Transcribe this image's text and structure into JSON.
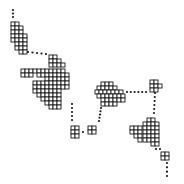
{
  "diagram": {
    "background": "#ffffff",
    "ink": "#1a1a1a",
    "cell_size": 4,
    "clusters": [
      {
        "name": "cluster-top-left",
        "cells": [
          [
            11,
            22
          ],
          [
            15,
            22
          ],
          [
            11,
            26
          ],
          [
            15,
            26
          ],
          [
            19,
            26
          ],
          [
            11,
            30
          ],
          [
            15,
            30
          ],
          [
            19,
            30
          ],
          [
            11,
            34
          ],
          [
            15,
            34
          ],
          [
            19,
            34
          ],
          [
            23,
            34
          ],
          [
            11,
            38
          ],
          [
            15,
            38
          ],
          [
            19,
            38
          ],
          [
            23,
            38
          ],
          [
            15,
            42
          ],
          [
            19,
            42
          ],
          [
            23,
            42
          ],
          [
            15,
            46
          ],
          [
            19,
            46
          ],
          [
            23,
            46
          ],
          [
            19,
            50
          ],
          [
            23,
            50
          ]
        ]
      },
      {
        "name": "cluster-center-left",
        "cells": [
          [
            49,
            55
          ],
          [
            53,
            55
          ],
          [
            49,
            59
          ],
          [
            53,
            59
          ],
          [
            57,
            59
          ],
          [
            49,
            63
          ],
          [
            53,
            63
          ],
          [
            57,
            63
          ],
          [
            61,
            63
          ],
          [
            21,
            69
          ],
          [
            25,
            69
          ],
          [
            29,
            69
          ],
          [
            33,
            69
          ],
          [
            37,
            69
          ],
          [
            41,
            69
          ],
          [
            45,
            69
          ],
          [
            49,
            69
          ],
          [
            53,
            69
          ],
          [
            57,
            69
          ],
          [
            61,
            69
          ],
          [
            21,
            73
          ],
          [
            25,
            73
          ],
          [
            29,
            73
          ],
          [
            37,
            73
          ],
          [
            41,
            73
          ],
          [
            45,
            73
          ],
          [
            49,
            73
          ],
          [
            53,
            73
          ],
          [
            57,
            73
          ],
          [
            61,
            73
          ],
          [
            65,
            73
          ],
          [
            45,
            77
          ],
          [
            49,
            77
          ],
          [
            53,
            77
          ],
          [
            57,
            77
          ],
          [
            61,
            77
          ],
          [
            65,
            77
          ],
          [
            33,
            81
          ],
          [
            37,
            81
          ],
          [
            41,
            81
          ],
          [
            45,
            81
          ],
          [
            49,
            81
          ],
          [
            53,
            81
          ],
          [
            57,
            81
          ],
          [
            61,
            81
          ],
          [
            65,
            81
          ],
          [
            33,
            85
          ],
          [
            37,
            85
          ],
          [
            41,
            85
          ],
          [
            45,
            85
          ],
          [
            49,
            85
          ],
          [
            53,
            85
          ],
          [
            57,
            85
          ],
          [
            61,
            85
          ],
          [
            65,
            85
          ],
          [
            33,
            89
          ],
          [
            37,
            89
          ],
          [
            41,
            89
          ],
          [
            45,
            89
          ],
          [
            49,
            89
          ],
          [
            53,
            89
          ],
          [
            57,
            89
          ],
          [
            37,
            93
          ],
          [
            41,
            93
          ],
          [
            45,
            93
          ],
          [
            49,
            93
          ],
          [
            53,
            93
          ],
          [
            57,
            93
          ],
          [
            41,
            97
          ],
          [
            45,
            97
          ],
          [
            49,
            97
          ],
          [
            53,
            97
          ],
          [
            57,
            97
          ],
          [
            45,
            101
          ],
          [
            49,
            101
          ],
          [
            53,
            101
          ],
          [
            57,
            101
          ],
          [
            49,
            105
          ],
          [
            53,
            105
          ],
          [
            57,
            105
          ]
        ]
      },
      {
        "name": "cluster-small-pair-left",
        "cells": [
          [
            71,
            126
          ],
          [
            75,
            126
          ],
          [
            71,
            130
          ],
          [
            75,
            130
          ],
          [
            71,
            134
          ],
          [
            75,
            134
          ]
        ]
      },
      {
        "name": "cluster-small-pair-right",
        "cells": [
          [
            88,
            126
          ],
          [
            92,
            126
          ],
          [
            88,
            130
          ],
          [
            92,
            130
          ]
        ]
      },
      {
        "name": "cluster-center",
        "cells": [
          [
            101,
            82
          ],
          [
            105,
            82
          ],
          [
            109,
            82
          ],
          [
            97,
            86
          ],
          [
            101,
            86
          ],
          [
            105,
            86
          ],
          [
            109,
            86
          ],
          [
            113,
            86
          ],
          [
            95,
            90
          ],
          [
            99,
            90
          ],
          [
            103,
            90
          ],
          [
            107,
            90
          ],
          [
            111,
            90
          ],
          [
            115,
            90
          ],
          [
            119,
            90
          ],
          [
            97,
            94
          ],
          [
            101,
            94
          ],
          [
            105,
            94
          ],
          [
            109,
            94
          ],
          [
            113,
            94
          ],
          [
            117,
            94
          ],
          [
            121,
            94
          ],
          [
            101,
            98
          ],
          [
            105,
            98
          ],
          [
            109,
            98
          ],
          [
            113,
            98
          ],
          [
            117,
            98
          ],
          [
            121,
            98
          ],
          [
            101,
            102
          ],
          [
            105,
            102
          ],
          [
            109,
            102
          ],
          [
            113,
            102
          ]
        ]
      },
      {
        "name": "cluster-top-right",
        "cells": [
          [
            150,
            80
          ],
          [
            154,
            80
          ],
          [
            150,
            84
          ],
          [
            154,
            84
          ],
          [
            158,
            84
          ],
          [
            150,
            88
          ],
          [
            154,
            88
          ]
        ]
      },
      {
        "name": "cluster-bottom-right",
        "cells": [
          [
            147,
            118
          ],
          [
            151,
            118
          ],
          [
            143,
            122
          ],
          [
            147,
            122
          ],
          [
            151,
            122
          ],
          [
            155,
            122
          ],
          [
            130,
            126
          ],
          [
            134,
            126
          ],
          [
            138,
            126
          ],
          [
            143,
            126
          ],
          [
            147,
            126
          ],
          [
            151,
            126
          ],
          [
            155,
            126
          ],
          [
            130,
            130
          ],
          [
            134,
            130
          ],
          [
            138,
            130
          ],
          [
            143,
            130
          ],
          [
            147,
            130
          ],
          [
            151,
            130
          ],
          [
            155,
            130
          ],
          [
            134,
            134
          ],
          [
            138,
            134
          ],
          [
            143,
            134
          ],
          [
            147,
            134
          ],
          [
            151,
            134
          ],
          [
            155,
            134
          ],
          [
            138,
            138
          ],
          [
            143,
            138
          ],
          [
            147,
            138
          ],
          [
            151,
            138
          ],
          [
            155,
            138
          ],
          [
            151,
            142
          ],
          [
            155,
            142
          ]
        ]
      },
      {
        "name": "cluster-bottom-tail",
        "cells": [
          [
            161,
            152
          ],
          [
            165,
            152
          ],
          [
            161,
            156
          ],
          [
            165,
            156
          ]
        ]
      }
    ],
    "dotted_paths": [
      {
        "name": "path-top-entry",
        "points": [
          [
            13,
            10
          ],
          [
            13,
            17
          ]
        ],
        "dots": 3
      },
      {
        "name": "path-cluster1-to-cluster2",
        "points": [
          [
            28,
            52
          ],
          [
            46,
            54
          ]
        ],
        "dots": 5
      },
      {
        "name": "path-cluster2-down",
        "points": [
          [
            72,
            104
          ],
          [
            72,
            120
          ]
        ],
        "dots": 5
      },
      {
        "name": "path-pair-link",
        "points": [
          [
            82,
            132
          ],
          [
            84,
            132
          ]
        ],
        "dots": 1
      },
      {
        "name": "path-center-down",
        "points": [
          [
            101,
            108
          ],
          [
            99,
            121
          ]
        ],
        "dots": 5
      },
      {
        "name": "path-center-to-topright",
        "points": [
          [
            127,
            92
          ],
          [
            146,
            92
          ]
        ],
        "dots": 6
      },
      {
        "name": "path-topright-down",
        "points": [
          [
            155,
            93
          ],
          [
            154,
            113
          ]
        ],
        "dots": 6
      },
      {
        "name": "path-bottomright-to-tail",
        "points": [
          [
            156,
            149
          ],
          [
            160,
            149
          ]
        ],
        "dots": 2
      },
      {
        "name": "path-tail-down",
        "points": [
          [
            167,
            163
          ],
          [
            167,
            176
          ]
        ],
        "dots": 4
      }
    ]
  }
}
